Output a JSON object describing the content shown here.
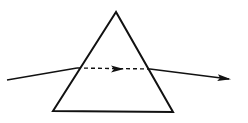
{
  "diagram": {
    "colors": {
      "background": "#ffffff",
      "stroke": "#111111"
    },
    "prism": {
      "apex": [
        116,
        12
      ],
      "bottom_left": [
        53,
        111
      ],
      "bottom_right": [
        173,
        112
      ]
    },
    "incident_ray": {
      "start": [
        7,
        80
      ],
      "end": [
        77,
        68
      ]
    },
    "internal_ray": {
      "start": [
        77,
        68
      ],
      "end": [
        150,
        69
      ],
      "style": "dashed",
      "arrow_at": [
        124,
        69
      ]
    },
    "emergent_ray": {
      "start": [
        150,
        69
      ],
      "end": [
        231,
        79
      ],
      "arrow_at": [
        231,
        79
      ]
    }
  }
}
